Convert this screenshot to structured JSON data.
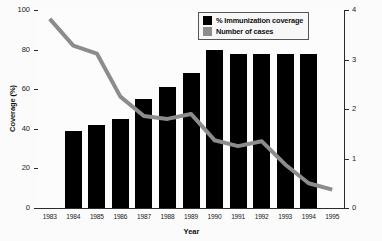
{
  "chart_data": {
    "type": "bar",
    "title": "",
    "xlabel": "Year",
    "ylabel": "Coverage (%)",
    "ylabel_right": "",
    "categories": [
      "1983",
      "1984",
      "1985",
      "1986",
      "1987",
      "1988",
      "1989",
      "1990",
      "1991",
      "1992",
      "1993",
      "1994",
      "1995"
    ],
    "ylim": [
      0,
      100
    ],
    "ylim_right": [
      0,
      4
    ],
    "yticks": [
      "0",
      "20",
      "40",
      "60",
      "80",
      "100"
    ],
    "yticks_right": [
      "0",
      "1",
      "2",
      "3",
      "4"
    ],
    "grid": false,
    "legend_position": "top-right",
    "series": [
      {
        "name": "% Immunization coverage",
        "type": "bar",
        "axis": "left",
        "color": "#000000",
        "values": [
          null,
          39,
          42,
          45,
          55,
          61,
          68,
          80,
          78,
          78,
          78,
          78,
          null
        ]
      },
      {
        "name": "Number of cases",
        "type": "line",
        "axis": "right",
        "color": "#8c8c8c",
        "values": [
          3.82,
          3.28,
          3.12,
          2.25,
          1.86,
          1.8,
          1.9,
          1.37,
          1.25,
          1.35,
          0.88,
          0.5,
          0.37
        ]
      }
    ]
  },
  "legend": {
    "items": [
      {
        "label": "% Immunization coverage",
        "swatch": "#000000"
      },
      {
        "label": "Number of cases",
        "swatch": "#8c8c8c"
      }
    ]
  },
  "axes": {
    "left_title": "Coverage (%)",
    "bottom_title": "Year"
  }
}
